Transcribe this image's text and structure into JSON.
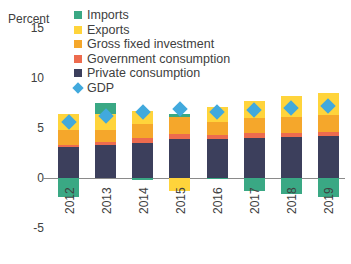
{
  "chart_data": {
    "type": "bar",
    "subtype": "stacked-bar-with-overlay-marker",
    "title": "",
    "xlabel": "",
    "ylabel": "Percent",
    "ylim": [
      -5,
      15
    ],
    "yticks": [
      15,
      10,
      5,
      0,
      -5
    ],
    "ytick_labels": [
      "15",
      "10",
      "5",
      "0",
      "-5"
    ],
    "grid": false,
    "legend_position": "top-left-inside",
    "categories": [
      "2012",
      "2013",
      "2014",
      "2015",
      "2016",
      "2017",
      "2018",
      "2019"
    ],
    "series": [
      {
        "name": "Private consumption",
        "color": "#3c3f5c",
        "type": "bar-segment",
        "values": [
          3.1,
          3.3,
          3.5,
          3.9,
          3.9,
          4.0,
          4.1,
          4.2
        ]
      },
      {
        "name": "Government consumption",
        "color": "#ed6b4e",
        "type": "bar-segment",
        "values": [
          0.2,
          0.3,
          0.5,
          0.5,
          0.4,
          0.5,
          0.4,
          0.4
        ]
      },
      {
        "name": "Gross fixed investment",
        "color": "#f5a72b",
        "type": "bar-segment",
        "values": [
          1.5,
          1.2,
          1.4,
          1.7,
          1.3,
          1.5,
          1.6,
          1.7
        ]
      },
      {
        "name": "Exports",
        "color": "#ffd43b",
        "type": "bar-segment",
        "values": [
          1.6,
          1.6,
          1.3,
          -1.3,
          1.5,
          1.7,
          2.1,
          2.2
        ]
      },
      {
        "name": "Imports",
        "color": "#3aa884",
        "type": "bar-segment",
        "values": [
          -1.9,
          1.1,
          -0.2,
          0.3,
          -0.1,
          -1.3,
          -1.6,
          -1.9
        ]
      },
      {
        "name": "GDP",
        "color": "#41a9dd",
        "type": "marker-diamond",
        "values": [
          5.6,
          6.2,
          6.6,
          6.9,
          6.6,
          6.8,
          7.0,
          7.2
        ]
      }
    ],
    "legend_entries": [
      "Imports",
      "Exports",
      "Gross fixed investment",
      "Government consumption",
      "Private consumption",
      "GDP"
    ]
  },
  "axis": {
    "unit_label": "Percent",
    "tick_15": "15",
    "tick_10": "10",
    "tick_5": "5",
    "tick_0": "0",
    "tick_m5": "-5"
  },
  "legend": {
    "imports": "Imports",
    "exports": "Exports",
    "gross_fixed_investment": "Gross fixed investment",
    "government_consumption": "Government consumption",
    "private_consumption": "Private consumption",
    "gdp": "GDP"
  },
  "colors": {
    "imports": "#3aa884",
    "exports": "#ffd43b",
    "gross_fixed_investment": "#f5a72b",
    "government_consumption": "#ed6b4e",
    "private_consumption": "#3c3f5c",
    "gdp": "#41a9dd",
    "axis": "#8a8a8a",
    "text": "#404040",
    "background": "#ffffff"
  },
  "xlabels": {
    "y2012": "2012",
    "y2013": "2013",
    "y2014": "2014",
    "y2015": "2015",
    "y2016": "2016",
    "y2017": "2017",
    "y2018": "2018",
    "y2019": "2019"
  }
}
